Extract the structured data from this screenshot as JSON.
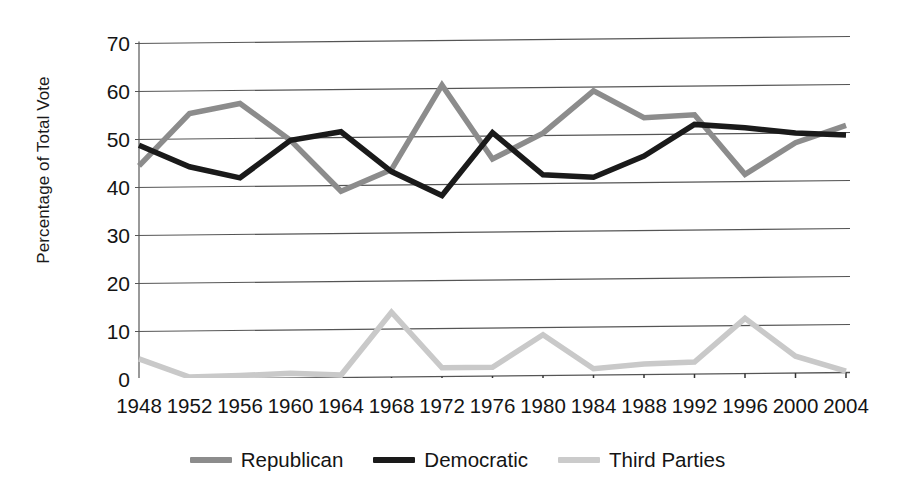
{
  "chart_data": {
    "type": "line",
    "title": "",
    "subtitle": "",
    "xlabel": "",
    "ylabel": "Percentage of Total Vote",
    "categories": [
      "1948",
      "1952",
      "1956",
      "1960",
      "1964",
      "1968",
      "1972",
      "1976",
      "1980",
      "1984",
      "1988",
      "1992",
      "1996",
      "2000",
      "2004"
    ],
    "xticklabels": [
      "1948",
      "1952",
      "1956",
      "1960",
      "1964",
      "1968",
      "1972",
      "1976",
      "1980",
      "1984",
      "1988",
      "1992",
      "1996",
      "2000",
      "2004"
    ],
    "yticklabels": [
      "0",
      "10",
      "20",
      "30",
      "40",
      "50",
      "60",
      "70"
    ],
    "ytickvalues": [
      0,
      10,
      20,
      30,
      40,
      50,
      60,
      70
    ],
    "ylim": [
      0,
      70
    ],
    "xlim": [
      "1948",
      "2004"
    ],
    "grid": "horizontal",
    "legend_position": "bottom-center",
    "series": [
      {
        "name": "Republican",
        "color": "#8c8c8c",
        "values": [
          44.5,
          55.2,
          57.4,
          49.5,
          38.5,
          43.4,
          60.7,
          48.0,
          50.7,
          58.8,
          53.4,
          37.4,
          40.7,
          47.9,
          50.7
        ]
      },
      {
        "name": "Democratic",
        "color": "#1a1a1a",
        "values": [
          49.5,
          44.4,
          42.0,
          49.7,
          61.1,
          42.7,
          37.5,
          50.1,
          41.0,
          40.6,
          45.6,
          43.0,
          49.2,
          48.4,
          48.3
        ]
      },
      {
        "name": "Third Parties",
        "color": "#c9c9c9",
        "values": [
          6.0,
          0.4,
          0.6,
          0.8,
          0.4,
          13.9,
          1.9,
          1.9,
          8.3,
          0.6,
          1.0,
          19.6,
          11.5,
          3.7,
          1.0
        ]
      }
    ],
    "plot_series": [
      {
        "name": "Republican",
        "color": "#8c8c8c",
        "values": [
          44.5,
          55.3,
          57.3,
          49.5,
          38.8,
          43.2,
          60.7,
          45.2,
          50.5,
          59.2,
          53.5,
          54.0,
          41.5,
          48.0,
          51.5
        ]
      },
      {
        "name": "Democratic",
        "color": "#1a1a1a",
        "values": [
          48.8,
          44.2,
          41.8,
          49.5,
          51.2,
          42.8,
          37.7,
          50.7,
          41.8,
          41.2,
          45.5,
          52.0,
          51.2,
          50.0,
          49.5
        ]
      },
      {
        "name": "Third Parties",
        "color": "#c9c9c9",
        "values": [
          4.3,
          0.4,
          0.6,
          1.0,
          0.5,
          13.5,
          1.8,
          1.8,
          8.5,
          1.3,
          2.2,
          2.5,
          11.5,
          3.5,
          0.3
        ]
      }
    ]
  },
  "legend": {
    "items": [
      {
        "label": "Republican",
        "color": "#8c8c8c"
      },
      {
        "label": "Democratic",
        "color": "#1a1a1a"
      },
      {
        "label": "Third Parties",
        "color": "#cbcbcb"
      }
    ]
  }
}
